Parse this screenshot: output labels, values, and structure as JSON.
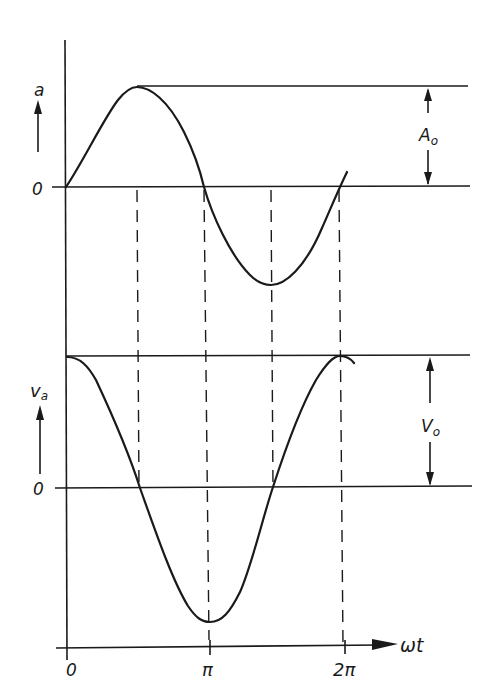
{
  "diagram": {
    "top_plot": {
      "y_label": "a",
      "zero_label": "0",
      "amplitude_label_main": "A",
      "amplitude_label_sub": "o",
      "curve": "sine",
      "description": "acceleration a vs ωt, sine wave from 0 to 2π"
    },
    "bottom_plot": {
      "y_label_main": "v",
      "y_label_sub": "a",
      "zero_label": "0",
      "amplitude_label_main": "V",
      "amplitude_label_sub": "o",
      "curve": "cosine",
      "description": "velocity v_a vs ωt, cosine wave from 0 to 2π"
    },
    "x_axis": {
      "label": "ωt",
      "ticks": [
        "0",
        "π",
        "2π"
      ]
    },
    "colors": {
      "ink": "#1a1a1a",
      "background": "#ffffff"
    }
  }
}
